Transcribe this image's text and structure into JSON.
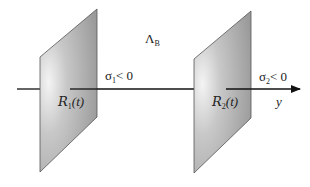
{
  "diagram": {
    "region_label": {
      "main": "Λ",
      "sub": "B"
    },
    "axis": {
      "label": "y"
    },
    "planes": [
      {
        "id": "R1",
        "symbol": "R",
        "subscript": "1",
        "arg": "(t)",
        "sigma_main": "σ",
        "sigma_sub": "1",
        "sigma_cond": "< 0"
      },
      {
        "id": "R2",
        "symbol": "R",
        "subscript": "2",
        "arg": "(t)",
        "sigma_main": "σ",
        "sigma_sub": "2",
        "sigma_cond": "< 0"
      }
    ],
    "colors": {
      "plane_fill_light": "#f4f4f4",
      "plane_fill_dark": "#9a9a9a",
      "plane_edge": "#555555",
      "axis": "#111111"
    }
  }
}
